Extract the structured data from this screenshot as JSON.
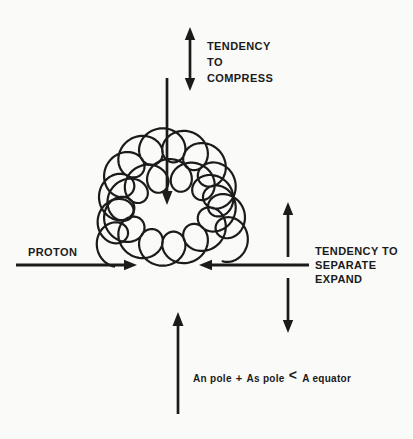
{
  "colors": {
    "ink": "#1b1b1b",
    "paper": "#fafaf8"
  },
  "labels": {
    "compress": "TENDENCY\nTO\nCOMPRESS",
    "proton": "PROTON",
    "separate_expand": "TENDENCY TO\nSEPARATE\nEXPAND",
    "formula": {
      "term1": "An pole",
      "operator_plus": "+",
      "term2": "As pole",
      "operator_less_than": "<",
      "term3": "A equator"
    }
  }
}
